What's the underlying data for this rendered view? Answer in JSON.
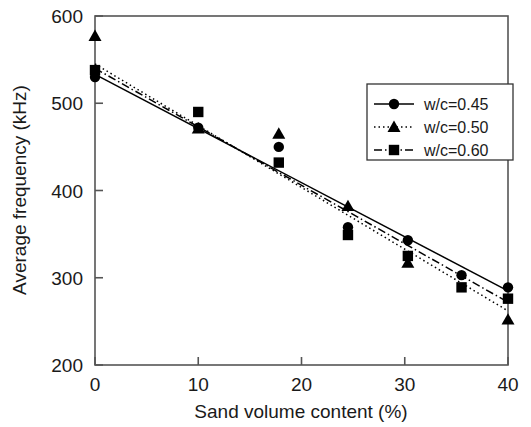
{
  "chart_data": {
    "type": "scatter",
    "title": "",
    "xlabel": "Sand volume content (%)",
    "ylabel": "Average frequency (kHz)",
    "xlim": [
      0,
      40
    ],
    "ylim": [
      200,
      600
    ],
    "xticks": [
      0,
      10,
      20,
      30,
      40
    ],
    "yticks": [
      200,
      300,
      400,
      500,
      600
    ],
    "grid": false,
    "legend_position": "upper right",
    "series": [
      {
        "name": "w/c=0.45",
        "marker": "circle",
        "linestyle": "solid",
        "color": "#000000",
        "points": [
          {
            "x": 0.0,
            "y": 530
          },
          {
            "x": 10.0,
            "y": 472
          },
          {
            "x": 17.8,
            "y": 450
          },
          {
            "x": 24.5,
            "y": 358
          },
          {
            "x": 30.3,
            "y": 343
          },
          {
            "x": 35.5,
            "y": 303
          },
          {
            "x": 40.0,
            "y": 289
          }
        ],
        "fit_endpoints": [
          {
            "x": 0,
            "y": 533
          },
          {
            "x": 40,
            "y": 285
          }
        ]
      },
      {
        "name": "w/c=0.50",
        "marker": "triangle",
        "linestyle": "dotted",
        "color": "#000000",
        "points": [
          {
            "x": 0.0,
            "y": 577
          },
          {
            "x": 10.0,
            "y": 471
          },
          {
            "x": 17.8,
            "y": 465
          },
          {
            "x": 24.5,
            "y": 382
          },
          {
            "x": 30.3,
            "y": 317
          },
          {
            "x": 40.0,
            "y": 252
          }
        ],
        "fit_endpoints": [
          {
            "x": 0,
            "y": 545
          },
          {
            "x": 40,
            "y": 262
          }
        ]
      },
      {
        "name": "w/c=0.60",
        "marker": "square",
        "linestyle": "dashdot",
        "color": "#000000",
        "points": [
          {
            "x": 0.0,
            "y": 538
          },
          {
            "x": 10.0,
            "y": 490
          },
          {
            "x": 17.8,
            "y": 432
          },
          {
            "x": 24.5,
            "y": 349
          },
          {
            "x": 30.3,
            "y": 325
          },
          {
            "x": 35.5,
            "y": 289
          },
          {
            "x": 40.0,
            "y": 276
          }
        ],
        "fit_endpoints": [
          {
            "x": 0,
            "y": 540
          },
          {
            "x": 40,
            "y": 272
          }
        ]
      }
    ],
    "legend_entries": [
      {
        "label": "w/c=0.45",
        "marker": "circle",
        "linestyle": "solid"
      },
      {
        "label": "w/c=0.50",
        "marker": "triangle",
        "linestyle": "dotted"
      },
      {
        "label": "w/c=0.60",
        "marker": "square",
        "linestyle": "dashdot"
      }
    ]
  },
  "axes": {
    "x_tick_labels": [
      "0",
      "10",
      "20",
      "30",
      "40"
    ],
    "y_tick_labels": [
      "200",
      "300",
      "400",
      "500",
      "600"
    ],
    "xlabel": "Sand volume content (%)",
    "ylabel": "Average frequency (kHz)"
  },
  "legend": {
    "items": [
      {
        "label": "w/c=0.45"
      },
      {
        "label": "w/c=0.50"
      },
      {
        "label": "w/c=0.60"
      }
    ]
  },
  "colors": {
    "ink": "#1a1a1a",
    "frame": "#555555",
    "background": "#ffffff"
  }
}
